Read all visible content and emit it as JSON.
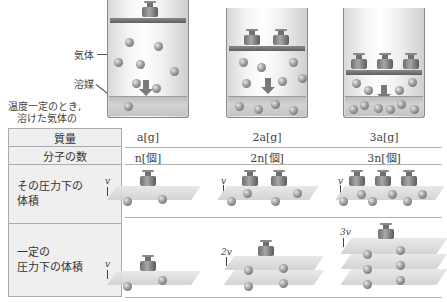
{
  "diagram": {
    "labels": {
      "gas": "気体",
      "solvent": "溶媒",
      "caption_line1": "温度一定のとき,",
      "caption_line2": "溶けた気体の"
    },
    "columns": [
      {
        "weights": 1,
        "mass": "a[g]",
        "molecules": "n[個]",
        "volume_at_pressure": "v",
        "volume_const_pressure": "v"
      },
      {
        "weights": 2,
        "mass": "2a[g]",
        "molecules": "2n[個]",
        "volume_at_pressure": "v",
        "volume_const_pressure": "2v"
      },
      {
        "weights": 3,
        "mass": "3a[g]",
        "molecules": "3n[個]",
        "volume_at_pressure": "v",
        "volume_const_pressure": "3v"
      }
    ],
    "rows": {
      "mass": "質量",
      "molecules": "分子の数",
      "vol_at_pressure_line1": "その圧力下の",
      "vol_at_pressure_line2": "体積",
      "vol_const_line1": "一定の",
      "vol_const_line2": "圧力下の体積"
    }
  }
}
